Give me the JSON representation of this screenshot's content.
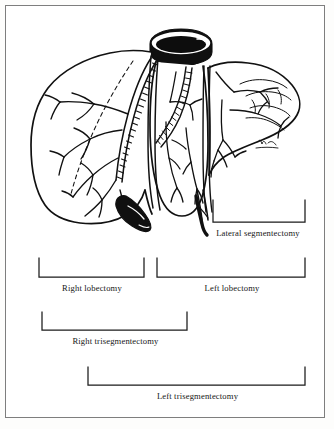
{
  "figure": {
    "anatomy_parts": [
      "inferior-vena-cava",
      "right-lobe",
      "medial-segment",
      "lateral-segment",
      "gallbladder",
      "portal-vein-branches",
      "hepatic-artery",
      "bile-duct",
      "falciform-ligament"
    ],
    "artist_signature": "signature-mark"
  },
  "brackets": [
    {
      "id": "lateral-segmentectomy",
      "label": "Lateral segmentectomy",
      "x1": 213,
      "x2": 305,
      "baseline_y": 222,
      "tick_top_y": 200,
      "label_y": 228
    },
    {
      "id": "right-lobectomy",
      "label": "Right lobectomy",
      "x1": 39,
      "x2": 144,
      "baseline_y": 277,
      "tick_top_y": 258,
      "label_y": 283
    },
    {
      "id": "left-lobectomy",
      "label": "Left lobectomy",
      "x1": 157,
      "x2": 305,
      "baseline_y": 277,
      "tick_top_y": 258,
      "label_y": 283
    },
    {
      "id": "right-trisegmentectomy",
      "label": "Right trisegmentectomy",
      "x1": 42,
      "x2": 187,
      "baseline_y": 330,
      "tick_top_y": 312,
      "label_y": 336
    },
    {
      "id": "left-trisegmentectomy",
      "label": "Left trisegmentectomy",
      "x1": 88,
      "x2": 305,
      "baseline_y": 385,
      "tick_top_y": 367,
      "label_y": 391
    }
  ],
  "colors": {
    "ink": "#111111",
    "frame": "#7e7e7e",
    "paper": "#ffffff",
    "bracket": "#1b1b1b"
  }
}
